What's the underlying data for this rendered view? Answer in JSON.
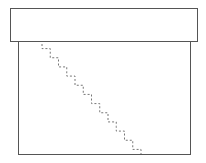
{
  "diagram": {
    "shapes": [
      {
        "id": "top-rectangle",
        "type": "rectangle"
      },
      {
        "id": "bottom-rectangle",
        "type": "rectangle"
      }
    ],
    "connector": {
      "type": "dashed-staircase",
      "color": "#777777",
      "start": [
        42,
        44
      ],
      "end": [
        141,
        154
      ],
      "steps": 12
    }
  }
}
